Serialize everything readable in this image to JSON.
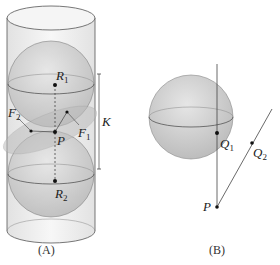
{
  "figure": {
    "panel_a": {
      "caption": "(A)",
      "labels": {
        "R1": "R",
        "R1_sub": "1",
        "R2": "R",
        "R2_sub": "2",
        "F1": "F",
        "F1_sub": "1",
        "F2": "F",
        "F2_sub": "2",
        "P": "P",
        "K": "K"
      }
    },
    "panel_b": {
      "caption": "(B)",
      "labels": {
        "Q1": "Q",
        "Q1_sub": "1",
        "Q2": "Q",
        "Q2_sub": "2",
        "P": "P"
      }
    },
    "colors": {
      "sphere_fill": "#d4d4d4",
      "cylinder_fill": "#efefef",
      "line": "#444444"
    }
  }
}
